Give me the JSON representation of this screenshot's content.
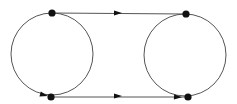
{
  "diagram": {
    "type": "graph",
    "background": "#ffffff",
    "stroke_color": "#555555",
    "node_color": "#111111",
    "circles": [
      {
        "id": "left-circle",
        "cx": 52,
        "cy": 54,
        "r": 41
      },
      {
        "id": "right-circle",
        "cx": 185,
        "cy": 55,
        "r": 41
      }
    ],
    "nodes": [
      {
        "id": "top-left",
        "x": 52,
        "y": 13
      },
      {
        "id": "bottom-left",
        "x": 51,
        "y": 97
      },
      {
        "id": "top-right",
        "x": 186,
        "y": 14
      },
      {
        "id": "bottom-right",
        "x": 188,
        "y": 97
      }
    ],
    "edges": [
      {
        "from": "top-left",
        "to": "top-right",
        "directed": true
      },
      {
        "from": "bottom-left",
        "to": "bottom-right",
        "directed": true
      }
    ],
    "arrowheads": [
      {
        "x": 118,
        "y": 13,
        "angle": 0
      },
      {
        "x": 118,
        "y": 96,
        "angle": 0
      },
      {
        "x": 44,
        "y": 95,
        "angle": 15
      },
      {
        "x": 178,
        "y": 97,
        "angle": 3
      }
    ]
  }
}
